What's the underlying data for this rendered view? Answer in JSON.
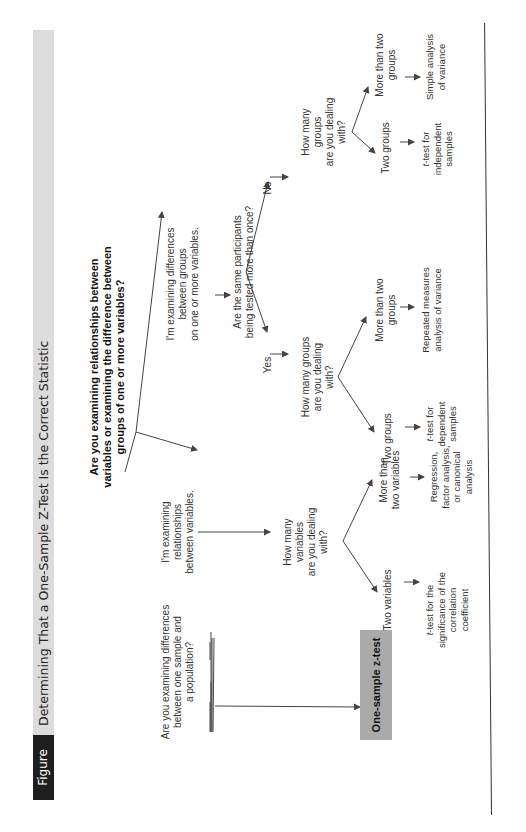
{
  "figure": {
    "label": "Figure 10.1",
    "title": "Determining That a One-Sample Z-Test Is the Correct Statistic",
    "colors": {
      "label_bg": "#1e1e1e",
      "title_bg": "#dcdcdc",
      "result_box": "#aaaaaa",
      "lines": "#444444"
    }
  },
  "diagram": {
    "root_question": {
      "line1": "Are you examining relationships between",
      "line2": "variables or examining the difference between",
      "line3": "groups of one or more variables?"
    },
    "side_question": {
      "line1": "Are you examining differences",
      "line2": "between one sample and",
      "line3": "a population?"
    },
    "result": "One-sample z-test",
    "relationships_branch": {
      "statement": {
        "line1": "I'm examining",
        "line2": "relationships",
        "line3": "between variables."
      },
      "question": {
        "line1": "How many",
        "line2": "variables",
        "line3": "are you dealing",
        "line4": "with?"
      },
      "two_variables": {
        "label": "Two variables",
        "outcome": {
          "line1_t": "t",
          "line1_rest": "-test for the",
          "line2": "significance of the",
          "line3": "correlation",
          "line4": "coefficient"
        }
      },
      "more_variables": {
        "label": {
          "line1": "More than",
          "line2": "two variables"
        },
        "outcome": {
          "line1": "Regression,",
          "line2": "factor analysis,",
          "line3": "or canonical",
          "line4": "analysis"
        }
      }
    },
    "differences_branch": {
      "statement": {
        "line1": "I'm examining differences",
        "line2": "between groups",
        "line3": "on one or more variables."
      },
      "question": {
        "line1": "Are the same participants",
        "line2": "being tested more than once?"
      },
      "yes": {
        "label": "Yes",
        "question": {
          "line1": "How many groups",
          "line2": "are you dealing",
          "line3": "with?"
        },
        "two_groups": {
          "label": "Two groups",
          "outcome": {
            "line1_t": "t",
            "line1_rest": "-test for",
            "line2": "dependent",
            "line3": "samples"
          }
        },
        "more_groups": {
          "label": {
            "line1": "More than two",
            "line2": "groups"
          },
          "outcome": {
            "line1": "Repeated measures",
            "line2": "analysis of variance"
          }
        }
      },
      "no": {
        "label": "No",
        "question": {
          "line1": "How many",
          "line2": "groups",
          "line3": "are you dealing",
          "line4": "with?"
        },
        "two_groups": {
          "label": "Two groups",
          "outcome": {
            "line1_t": "t",
            "line1_rest": "-test for",
            "line2": "independent",
            "line3": "samples"
          }
        },
        "more_groups": {
          "label": {
            "line1": "More than two",
            "line2": "groups"
          },
          "outcome": {
            "line1": "Simple analysis",
            "line2": "of variance"
          }
        }
      }
    }
  }
}
